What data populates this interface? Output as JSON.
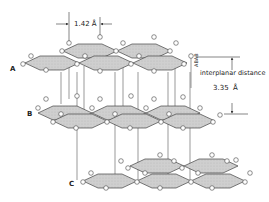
{
  "figure": {
    "type": "crystal structure diagram",
    "layers": [
      {
        "id": "A",
        "label": "A"
      },
      {
        "id": "B",
        "label": "B"
      },
      {
        "id": "C",
        "label": "C"
      }
    ],
    "bond_length": {
      "value": "1.42",
      "unit": "Å"
    },
    "interplanar": {
      "side_label": "ABAB",
      "label": "interplanar distance",
      "value": "3.35",
      "unit": "Å"
    },
    "colors": {
      "plane_fill": "#c8c8c8",
      "line": "#444444",
      "atom_fill": "#ffffff"
    }
  }
}
